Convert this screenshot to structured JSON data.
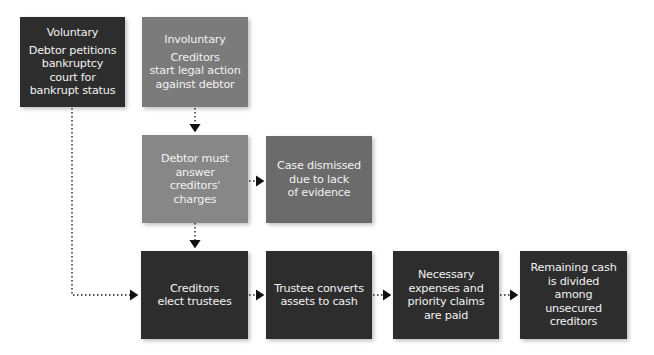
{
  "diagram": {
    "nodes": [
      {
        "id": "voluntary",
        "title": "Voluntary",
        "lines": [
          "Debtor petitions",
          "bankruptcy",
          "court for",
          "bankrupt status"
        ]
      },
      {
        "id": "involuntary",
        "title": "Involuntary",
        "lines": [
          "Creditors",
          "start legal action",
          "against debtor"
        ]
      },
      {
        "id": "debtor-answer",
        "lines": [
          "Debtor must",
          "answer",
          "creditors'",
          "charges"
        ]
      },
      {
        "id": "case-dismissed",
        "lines": [
          "Case dismissed",
          "due to lack",
          "of evidence"
        ]
      },
      {
        "id": "elect-trustees",
        "lines": [
          "Creditors",
          "elect trustees"
        ]
      },
      {
        "id": "trustee-converts",
        "lines": [
          "Trustee converts",
          "assets to cash"
        ]
      },
      {
        "id": "expenses-paid",
        "lines": [
          "Necessary",
          "expenses and",
          "priority claims",
          "are paid"
        ]
      },
      {
        "id": "remaining-cash",
        "lines": [
          "Remaining cash",
          "is divided",
          "among",
          "unsecured",
          "creditors"
        ]
      }
    ],
    "edges": [
      {
        "from": "involuntary",
        "to": "debtor-answer"
      },
      {
        "from": "debtor-answer",
        "to": "case-dismissed"
      },
      {
        "from": "debtor-answer",
        "to": "elect-trustees"
      },
      {
        "from": "voluntary",
        "to": "elect-trustees"
      },
      {
        "from": "elect-trustees",
        "to": "trustee-converts"
      },
      {
        "from": "trustee-converts",
        "to": "expenses-paid"
      },
      {
        "from": "expenses-paid",
        "to": "remaining-cash"
      }
    ],
    "colors": {
      "dark": "#2d2d2d",
      "medium": "#6b6b6b",
      "light": "#878787",
      "text": "#f2f2f2"
    }
  }
}
